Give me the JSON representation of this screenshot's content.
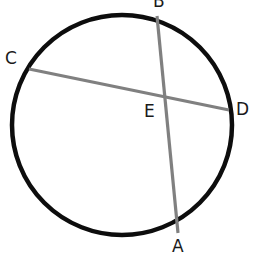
{
  "figure": {
    "background_color": "#ffffff",
    "width": 256,
    "height": 262
  },
  "circle": {
    "name": "circle-outline",
    "center_x": 122,
    "center_y": 125,
    "radius": 110,
    "stroke_color": "#0d0d0d",
    "stroke_width": 4.5,
    "fill": "none"
  },
  "chords": [
    {
      "id": "chord-AB",
      "label": "AB",
      "from_point": "B",
      "to_point": "A",
      "x1": 157,
      "y1": 16,
      "x2": 178,
      "y2": 233,
      "stroke_color": "#808080",
      "stroke_width": 3.2
    },
    {
      "id": "chord-CD",
      "label": "CD",
      "from_point": "C",
      "to_point": "D",
      "x1": 29,
      "y1": 69,
      "x2": 229,
      "y2": 110,
      "stroke_color": "#808080",
      "stroke_width": 3.2
    }
  ],
  "intersection": {
    "id": "point-E",
    "label": "E",
    "x": 164,
    "y": 98
  },
  "labels": {
    "B": "B",
    "C": "C",
    "D": "D",
    "A": "A",
    "E": "E"
  },
  "label_color": "#1a1a1a"
}
